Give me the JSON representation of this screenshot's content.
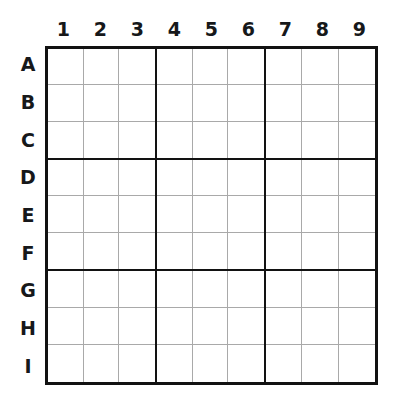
{
  "puzzle": {
    "name": "sudoku-grid",
    "size": 9,
    "box_size": 3,
    "column_headers": [
      "1",
      "2",
      "3",
      "4",
      "5",
      "6",
      "7",
      "8",
      "9"
    ],
    "row_headers": [
      "A",
      "B",
      "C",
      "D",
      "E",
      "F",
      "G",
      "H",
      "I"
    ],
    "cells": [
      [
        "",
        "",
        "",
        "",
        "",
        "",
        "",
        "",
        ""
      ],
      [
        "",
        "",
        "",
        "",
        "",
        "",
        "",
        "",
        ""
      ],
      [
        "",
        "",
        "",
        "",
        "",
        "",
        "",
        "",
        ""
      ],
      [
        "",
        "",
        "",
        "",
        "",
        "",
        "",
        "",
        ""
      ],
      [
        "",
        "",
        "",
        "",
        "",
        "",
        "",
        "",
        ""
      ],
      [
        "",
        "",
        "",
        "",
        "",
        "",
        "",
        "",
        ""
      ],
      [
        "",
        "",
        "",
        "",
        "",
        "",
        "",
        "",
        ""
      ],
      [
        "",
        "",
        "",
        "",
        "",
        "",
        "",
        "",
        ""
      ],
      [
        "",
        "",
        "",
        "",
        "",
        "",
        "",
        "",
        ""
      ]
    ]
  },
  "style": {
    "background": "#ffffff",
    "outer_border_color": "#121212",
    "box_border_color": "#121212",
    "cell_border_color": "#a9a9a9",
    "label_color": "#16181a"
  }
}
